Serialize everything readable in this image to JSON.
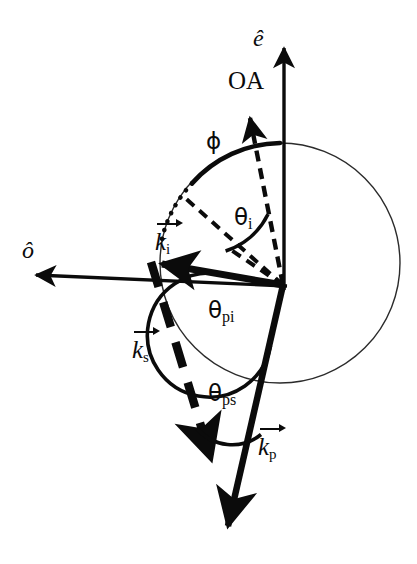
{
  "figure": {
    "type": "vector-geometry-diagram",
    "background_color": "#ffffff",
    "ink_color": "#0b0b0b"
  },
  "labels": {
    "e_hat": "ê",
    "o_hat": "ô",
    "optic_axis": "OA",
    "phi": "ϕ",
    "theta_i_base": "θ",
    "theta_i_sub": "i",
    "theta_pi_base": "θ",
    "theta_pi_sub": "pi",
    "theta_ps_base": "θ",
    "theta_ps_sub": "ps",
    "k_i_name": "k",
    "k_i_sub": "i",
    "k_s_name": "k",
    "k_s_sub": "s",
    "k_p_name": "k",
    "k_p_sub": "p"
  },
  "geometry": {
    "origin": {
      "x": 283,
      "y": 285
    },
    "circle": {
      "cx": 280,
      "cy": 263,
      "r": 120,
      "stroke_width": 1.4
    },
    "e_axis": {
      "x1": 284,
      "y1": 285,
      "x2": 284,
      "y2": 40
    },
    "o_axis": {
      "x1": 283,
      "y1": 285,
      "x2": 30,
      "y2": 274
    },
    "oa_vector": {
      "x1": 283,
      "y1": 285,
      "x2": 248,
      "y2": 106,
      "dashed": true
    },
    "k_i_vector": {
      "x1": 283,
      "y1": 285,
      "x2": 150,
      "y2": 262
    },
    "k_i_radial_dashed": {
      "x1": 283,
      "y1": 285,
      "x2": 180,
      "y2": 193
    },
    "k_s_vector": {
      "x1": 150,
      "y1": 262,
      "x2": 216,
      "y2": 468,
      "dashed": true
    },
    "k_p_vector": {
      "x1": 283,
      "y1": 285,
      "x2": 228,
      "y2": 534
    },
    "phi_arc": {
      "from_deg": 90,
      "to_deg": 137,
      "r": 120,
      "stroke_width": 4
    },
    "phi_dotted_arc": {
      "from_deg": 137,
      "to_deg": 170,
      "r": 120
    },
    "theta_i_arc": {
      "r": 84,
      "stroke_width": 3.5
    },
    "theta_pi_arc": {
      "r": 62,
      "stroke_width": 3.5
    },
    "theta_ps_arc": {
      "r": 52,
      "stroke_width": 3.5
    }
  },
  "label_positions": {
    "e_hat": {
      "left": 253,
      "top": 26
    },
    "optic_axis": {
      "left": 228,
      "top": 68
    },
    "phi": {
      "left": 206,
      "top": 130
    },
    "theta_i": {
      "left": 234,
      "top": 206
    },
    "o_hat": {
      "left": 22,
      "top": 238
    },
    "k_i": {
      "left": 155,
      "top": 219
    },
    "theta_pi": {
      "left": 208,
      "top": 299
    },
    "k_s": {
      "left": 132,
      "top": 327
    },
    "theta_ps": {
      "left": 208,
      "top": 382
    },
    "k_p": {
      "left": 258,
      "top": 424
    }
  }
}
